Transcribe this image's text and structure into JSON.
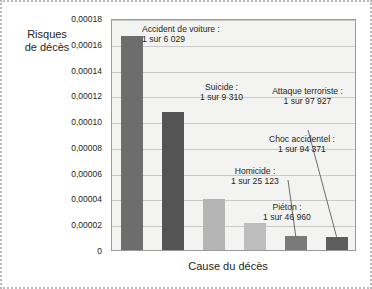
{
  "chart_data": {
    "type": "bar",
    "title": "",
    "xlabel": "Cause du décès",
    "ylabel": "Risques de décès",
    "ylim": [
      0,
      0.00018
    ],
    "grid": true,
    "legend": "none",
    "ytick_labels": [
      "0,00018",
      "0,00016",
      "0,00014",
      "0,00012",
      "0,00010",
      "0,00008",
      "0,00006",
      "0,00004",
      "0,00002",
      "0"
    ],
    "ytick_values": [
      0.00018,
      0.00016,
      0.00014,
      0.00012,
      0.0001,
      8e-05,
      6e-05,
      4e-05,
      2e-05,
      0
    ],
    "categories": [
      "Accident de voiture",
      "Suicide",
      "Homicide",
      "Piéton",
      "Choc accidentel",
      "Attaque terroriste"
    ],
    "values": [
      0.00016587,
      0.00010741,
      3.98e-05,
      2.129e-05,
      1.06e-05,
      1.021e-05
    ],
    "odds": [
      "1 sur 6 029",
      "1 sur 9 310",
      "1 sur 25 123",
      "1 sur 46 960",
      "1 sur 94 371",
      "1 sur 97 927"
    ],
    "bar_colors": [
      "#6d6d6d",
      "#545454",
      "#b4b4b4",
      "#bdbdbd",
      "#7a7a7a",
      "#5d5d5d"
    ],
    "annotations": [
      {
        "name": "accident-de-voiture",
        "title": "Accident de voiture :",
        "odds": "1 sur 6 029",
        "leader": false
      },
      {
        "name": "suicide",
        "title": "Suicide :",
        "odds": "1 sur 9 310",
        "leader": false
      },
      {
        "name": "homicide",
        "title": "Homicide :",
        "odds": "1 sur 25 123",
        "leader": false
      },
      {
        "name": "pieton",
        "title": "Piéton :",
        "odds": "1 sur 46 960",
        "leader": false
      },
      {
        "name": "choc-accidentel",
        "title": "Choc accidentel :",
        "odds": "1 sur 94 371",
        "leader": true
      },
      {
        "name": "attaque-terroriste",
        "title": "Attaque terroriste :",
        "odds": "1 sur 97 927",
        "leader": true
      }
    ]
  },
  "axes": {
    "y_title_line1": "Risques",
    "y_title_line2": "de décès",
    "x_title": "Cause du décès"
  }
}
